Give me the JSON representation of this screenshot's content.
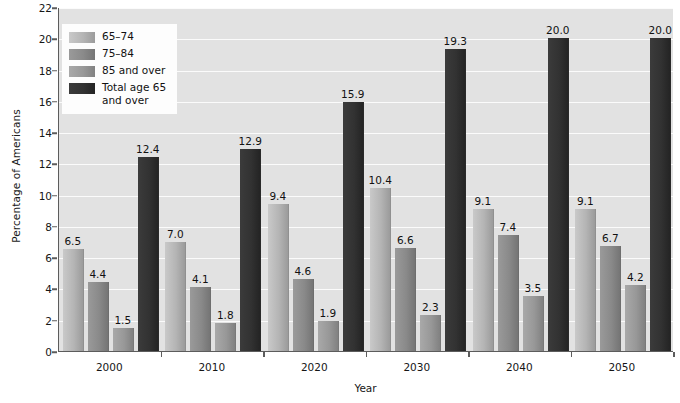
{
  "chart_data": {
    "type": "bar",
    "title": "",
    "xlabel": "Year",
    "ylabel": "Percentage of Americans",
    "categories": [
      "2000",
      "2010",
      "2020",
      "2030",
      "2040",
      "2050"
    ],
    "ylim": [
      0,
      22
    ],
    "ytick_step": 2,
    "yticks": [
      "0",
      "2",
      "4",
      "6",
      "8",
      "10",
      "12",
      "14",
      "16",
      "18",
      "20",
      "22"
    ],
    "grid": true,
    "legend_position": "top-left",
    "series": [
      {
        "name": "65–74",
        "color": "#b4b4b4",
        "values": [
          6.5,
          7.0,
          9.4,
          10.4,
          9.1,
          9.1
        ],
        "labels": [
          "6.5",
          "7.0",
          "9.4",
          "10.4",
          "9.1",
          "9.1"
        ]
      },
      {
        "name": "75–84",
        "color": "#8a8a8a",
        "values": [
          4.4,
          4.1,
          4.6,
          6.6,
          7.4,
          6.7
        ],
        "labels": [
          "4.4",
          "4.1",
          "4.6",
          "6.6",
          "7.4",
          "6.7"
        ]
      },
      {
        "name": "85 and over",
        "color": "#989898",
        "values": [
          1.5,
          1.8,
          1.9,
          2.3,
          3.5,
          4.2
        ],
        "labels": [
          "1.5",
          "1.8",
          "1.9",
          "2.3",
          "3.5",
          "4.2"
        ]
      },
      {
        "name": "Total age 65 and over",
        "color": "#323232",
        "values": [
          12.4,
          12.9,
          15.9,
          19.3,
          20.0,
          20.0
        ],
        "labels": [
          "12.4",
          "12.9",
          "15.9",
          "19.3",
          "20.0",
          "20.0"
        ]
      }
    ]
  },
  "legend": {
    "entries": [
      {
        "label": "65–74",
        "swatch": "s0"
      },
      {
        "label": "75–84",
        "swatch": "s1"
      },
      {
        "label": "85 and over",
        "swatch": "s2"
      },
      {
        "label": "Total age 65 and over",
        "swatch": "s3"
      }
    ]
  },
  "colors": {
    "plot_background": "#e2e2e2",
    "gridline": "#fbfbfb",
    "axis": "#5c5c5c",
    "text": "#161616",
    "legend_background": "#fdfdfd"
  }
}
